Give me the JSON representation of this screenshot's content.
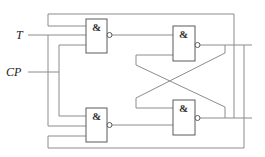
{
  "diagram": {
    "type": "logic-circuit",
    "inputs": [
      {
        "id": "T",
        "label": "T"
      },
      {
        "id": "CP",
        "label": "CP"
      }
    ],
    "gates": [
      {
        "id": "G1",
        "kind": "NAND",
        "symbol": "&"
      },
      {
        "id": "G2",
        "kind": "NAND",
        "symbol": "&"
      },
      {
        "id": "G3",
        "kind": "NAND",
        "symbol": "&"
      },
      {
        "id": "G4",
        "kind": "NAND",
        "symbol": "&"
      }
    ],
    "connections": [
      {
        "from": "G3.out",
        "to": "G1.in1",
        "note": "top feedback"
      },
      {
        "from": "T",
        "to": "G1.in2"
      },
      {
        "from": "CP",
        "to": "G1.in3"
      },
      {
        "from": "CP",
        "to": "G2.in1"
      },
      {
        "from": "T",
        "to": "G2.in2"
      },
      {
        "from": "G4.out",
        "to": "G2.in3",
        "note": "bottom feedback"
      },
      {
        "from": "G1.out",
        "to": "G3.in1"
      },
      {
        "from": "G4.out",
        "to": "G3.in2",
        "note": "cross-coupled"
      },
      {
        "from": "G3.out",
        "to": "G4.in1",
        "note": "cross-coupled"
      },
      {
        "from": "G2.out",
        "to": "G4.in2"
      }
    ],
    "colors": {
      "wire": "#8c8c8c",
      "gate_outline": "#5a5a5a",
      "text": "#222222"
    }
  }
}
